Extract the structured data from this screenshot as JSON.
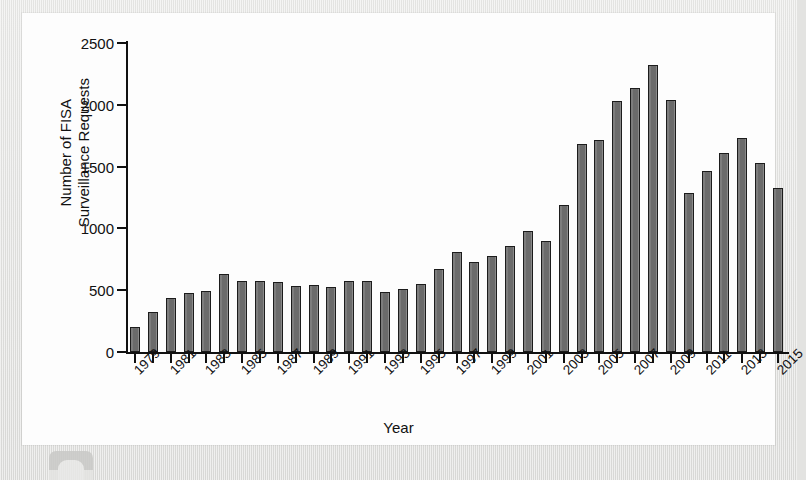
{
  "page": {
    "background_color": "#e3e3e1",
    "card_background_color": "#fdfdfd",
    "artifact_name": "scan-edge-artifact"
  },
  "chart_data": {
    "type": "bar",
    "title": "",
    "xlabel": "Year",
    "ylabel": "Number of FISA Surveillance Requests",
    "ylabel_lines": [
      "Number of FISA",
      "Surveillance Requests"
    ],
    "ylim": [
      0,
      2500
    ],
    "yticks": [
      0,
      500,
      1000,
      1500,
      2000,
      2500
    ],
    "ytick_labels": [
      "0",
      "500",
      "1000",
      "1500",
      "2000",
      "2500"
    ],
    "grid": false,
    "legend": false,
    "bar_color": "#6f6f6f",
    "bar_edge_color": "#1c1c1c",
    "categories": [
      "1979",
      "1980",
      "1981",
      "1982",
      "1983",
      "1984",
      "1985",
      "1986",
      "1987",
      "1988",
      "1989",
      "1990",
      "1991",
      "1992",
      "1993",
      "1994",
      "1995",
      "1996",
      "1997",
      "1998",
      "1999",
      "2000",
      "2001",
      "2002",
      "2003",
      "2004",
      "2005",
      "2006",
      "2007",
      "2008",
      "2009",
      "2010",
      "2011",
      "2012",
      "2013",
      "2014",
      "2015"
    ],
    "xtick_labels_shown": [
      "1979",
      "1981",
      "1983",
      "1985",
      "1987",
      "1989",
      "1991",
      "1993",
      "1995",
      "1997",
      "1999",
      "2001",
      "2003",
      "2005",
      "2007",
      "2009",
      "2011",
      "2013",
      "2015"
    ],
    "values": [
      199,
      322,
      433,
      475,
      497,
      635,
      573,
      573,
      563,
      534,
      546,
      523,
      577,
      574,
      484,
      509,
      552,
      668,
      813,
      732,
      774,
      857,
      977,
      900,
      1190,
      1680,
      1716,
      2031,
      2136,
      2321,
      2035,
      1284,
      1462,
      1614,
      1734,
      1533,
      1330
    ]
  }
}
